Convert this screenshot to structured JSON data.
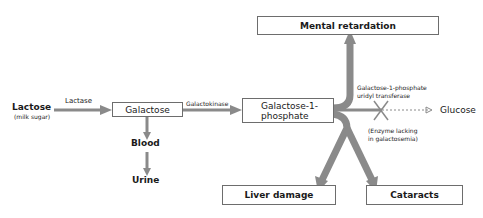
{
  "diagram": {
    "nodes": {
      "lactose": {
        "label": "Lactose",
        "sublabel": "(milk sugar)"
      },
      "galactose": {
        "label": "Galactose"
      },
      "galactose_1_phosphate": {
        "label_line1": "Galactose-1-",
        "label_line2": "phosphate"
      },
      "blood": {
        "label": "Blood"
      },
      "urine": {
        "label": "Urine"
      },
      "glucose": {
        "label": "Glucose"
      },
      "mental_retardation": {
        "label": "Mental retardation"
      },
      "liver_damage": {
        "label": "Liver damage"
      },
      "cataracts": {
        "label": "Cataracts"
      }
    },
    "enzymes": {
      "lactase": "Lactase",
      "galactokinase": "Galactokinase",
      "transferase_line1": "Galactose-1-phosphate",
      "transferase_line2": "uridyl transferase"
    },
    "note": {
      "line1": "(Enzyme lacking",
      "line2": "in galactosemia)"
    },
    "colors": {
      "arrow": "#8a8a8a",
      "box_border": "#6d6d6d",
      "text": "#1a1a1a"
    }
  }
}
